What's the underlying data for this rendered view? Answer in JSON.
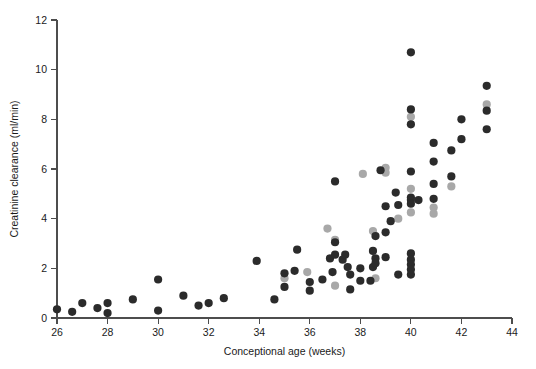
{
  "chart_data": {
    "type": "scatter",
    "title": "",
    "xlabel": "Conceptional age (weeks)",
    "ylabel": "Creatinine clearance (ml/min)",
    "xlim": [
      26,
      44
    ],
    "ylim": [
      0,
      12
    ],
    "xticks": [
      26,
      28,
      30,
      32,
      34,
      36,
      38,
      40,
      42,
      44
    ],
    "yticks": [
      0,
      2,
      4,
      6,
      8,
      10,
      12
    ],
    "grid": false,
    "legend": "none",
    "colors": {
      "dark": "#2b2b2b",
      "gray": "#a8a8a8",
      "axis": "#4d4d4d",
      "background": "#ffffff",
      "text": "#1a1a1a"
    },
    "marker": {
      "shape": "circle",
      "radius_px": 4.1
    },
    "series": [
      {
        "name": "dark",
        "color": "#2b2b2b",
        "points": [
          [
            26.0,
            0.35
          ],
          [
            26.6,
            0.25
          ],
          [
            27.0,
            0.6
          ],
          [
            27.6,
            0.4
          ],
          [
            28.0,
            0.6
          ],
          [
            28.0,
            0.2
          ],
          [
            29.0,
            0.75
          ],
          [
            30.0,
            1.55
          ],
          [
            30.0,
            0.3
          ],
          [
            31.0,
            0.9
          ],
          [
            31.6,
            0.5
          ],
          [
            32.0,
            0.6
          ],
          [
            32.6,
            0.8
          ],
          [
            33.9,
            2.3
          ],
          [
            34.6,
            0.75
          ],
          [
            35.0,
            1.25
          ],
          [
            35.0,
            1.8
          ],
          [
            35.4,
            1.9
          ],
          [
            35.5,
            2.75
          ],
          [
            36.0,
            1.45
          ],
          [
            36.0,
            1.1
          ],
          [
            36.5,
            1.55
          ],
          [
            36.8,
            2.4
          ],
          [
            36.9,
            1.85
          ],
          [
            37.0,
            3.05
          ],
          [
            37.0,
            2.55
          ],
          [
            37.0,
            5.5
          ],
          [
            37.3,
            2.35
          ],
          [
            37.4,
            2.55
          ],
          [
            37.5,
            2.05
          ],
          [
            37.6,
            1.75
          ],
          [
            37.6,
            1.15
          ],
          [
            38.0,
            1.5
          ],
          [
            38.0,
            2.0
          ],
          [
            38.4,
            1.5
          ],
          [
            38.5,
            2.05
          ],
          [
            38.5,
            2.7
          ],
          [
            38.6,
            2.4
          ],
          [
            38.6,
            2.2
          ],
          [
            38.6,
            3.3
          ],
          [
            38.8,
            5.95
          ],
          [
            39.0,
            4.5
          ],
          [
            39.0,
            3.45
          ],
          [
            39.0,
            2.45
          ],
          [
            39.2,
            3.9
          ],
          [
            39.4,
            5.05
          ],
          [
            39.5,
            4.55
          ],
          [
            39.5,
            1.75
          ],
          [
            40.0,
            10.7
          ],
          [
            40.0,
            8.4
          ],
          [
            40.0,
            7.8
          ],
          [
            40.0,
            5.9
          ],
          [
            40.0,
            4.85
          ],
          [
            40.0,
            4.75
          ],
          [
            40.0,
            4.6
          ],
          [
            40.3,
            4.75
          ],
          [
            40.0,
            2.6
          ],
          [
            40.0,
            2.35
          ],
          [
            40.0,
            2.15
          ],
          [
            40.0,
            1.95
          ],
          [
            40.0,
            1.75
          ],
          [
            40.9,
            7.05
          ],
          [
            40.9,
            6.3
          ],
          [
            40.9,
            5.4
          ],
          [
            40.9,
            4.8
          ],
          [
            41.6,
            6.75
          ],
          [
            41.6,
            5.7
          ],
          [
            42.0,
            7.2
          ],
          [
            42.0,
            8.0
          ],
          [
            43.0,
            9.35
          ],
          [
            43.0,
            7.6
          ],
          [
            43.0,
            8.35
          ]
        ]
      },
      {
        "name": "gray",
        "color": "#a8a8a8",
        "points": [
          [
            35.0,
            1.6
          ],
          [
            35.9,
            1.85
          ],
          [
            36.7,
            3.6
          ],
          [
            37.0,
            1.3
          ],
          [
            37.0,
            3.15
          ],
          [
            38.1,
            5.8
          ],
          [
            38.5,
            3.5
          ],
          [
            38.6,
            1.6
          ],
          [
            39.0,
            6.05
          ],
          [
            39.0,
            5.85
          ],
          [
            39.5,
            4.0
          ],
          [
            40.0,
            8.1
          ],
          [
            40.0,
            5.2
          ],
          [
            40.0,
            4.25
          ],
          [
            40.9,
            4.45
          ],
          [
            40.9,
            4.2
          ],
          [
            41.6,
            5.3
          ],
          [
            43.0,
            8.6
          ]
        ]
      }
    ]
  },
  "axis": {
    "x_title": "Conceptional age (weeks)",
    "y_title": "Creatinine clearance (ml/min)",
    "x_tick_labels": [
      "26",
      "28",
      "30",
      "32",
      "34",
      "36",
      "38",
      "40",
      "42",
      "44"
    ],
    "y_tick_labels": [
      "0",
      "2",
      "4",
      "6",
      "8",
      "10",
      "12"
    ]
  }
}
